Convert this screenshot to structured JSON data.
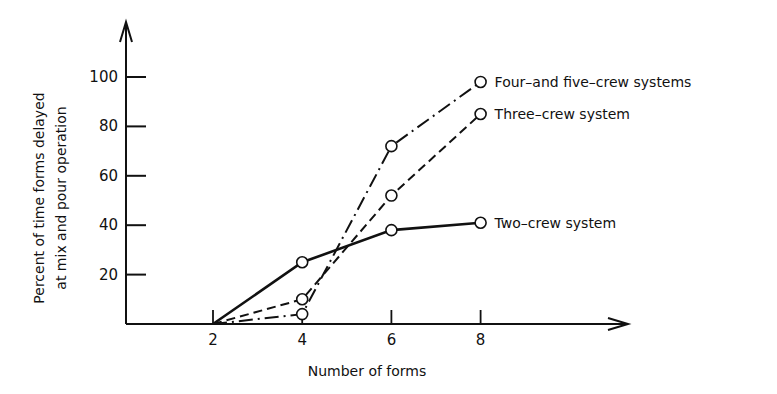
{
  "chart_data": {
    "type": "line",
    "title": "",
    "xlabel": "Number of forms",
    "ylabel_line1": "Percent of time forms delayed",
    "ylabel_line2": "at mix and pour operation",
    "x": [
      2,
      4,
      6,
      8
    ],
    "x_ticks": [
      "2",
      "4",
      "6",
      "8"
    ],
    "y_ticks": [
      "20",
      "40",
      "60",
      "80",
      "100"
    ],
    "xlim": [
      0,
      10
    ],
    "ylim": [
      0,
      110
    ],
    "grid": false,
    "legend_position": "inline-right",
    "series": [
      {
        "name": "Four–and five–crew systems",
        "style": "dash-dot",
        "values": [
          0,
          4,
          72,
          98
        ]
      },
      {
        "name": "Three–crew system",
        "style": "dashed",
        "values": [
          0,
          10,
          52,
          85
        ]
      },
      {
        "name": "Two–crew system",
        "style": "solid",
        "values": [
          0,
          25,
          38,
          41
        ]
      }
    ],
    "colors": {
      "ink": "#111111",
      "background": "#ffffff"
    }
  }
}
